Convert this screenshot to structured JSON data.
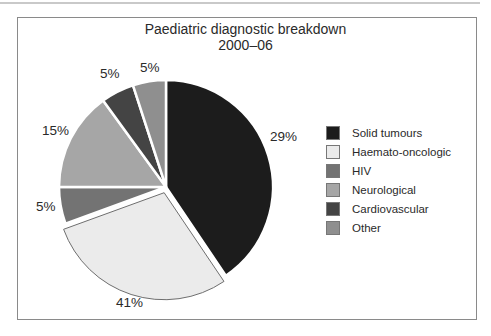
{
  "chart_data": {
    "type": "pie",
    "title": "Paediatric diagnostic breakdown",
    "subtitle": "2000–06",
    "categories": [
      "Solid tumours",
      "Haemato-oncologic",
      "HIV",
      "Neurological",
      "Cardiovascular",
      "Other"
    ],
    "values": [
      29,
      41,
      5,
      15,
      5,
      5
    ],
    "value_labels": [
      "29%",
      "41%",
      "5%",
      "15%",
      "5%",
      "5%"
    ],
    "colors": [
      "#1c1c1c",
      "#ebebeb",
      "#737373",
      "#a6a6a6",
      "#444444",
      "#8f8f8f"
    ],
    "exploded": [
      "Haemato-oncologic"
    ],
    "legend_position": "right",
    "start_angle_deg": 0,
    "direction": "clockwise"
  },
  "title": {
    "line1": "Paediatric diagnostic breakdown",
    "line2": "2000–06"
  },
  "labels": {
    "solid": "29%",
    "haemato": "41%",
    "hiv": "5%",
    "neuro": "15%",
    "cardio": "5%",
    "other": "5%"
  },
  "legend": [
    {
      "label": "Solid tumours",
      "color": "#1c1c1c"
    },
    {
      "label": "Haemato-oncologic",
      "color": "#ebebeb"
    },
    {
      "label": "HIV",
      "color": "#737373"
    },
    {
      "label": "Neurological",
      "color": "#a6a6a6"
    },
    {
      "label": "Cardiovascular",
      "color": "#444444"
    },
    {
      "label": "Other",
      "color": "#8f8f8f"
    }
  ]
}
